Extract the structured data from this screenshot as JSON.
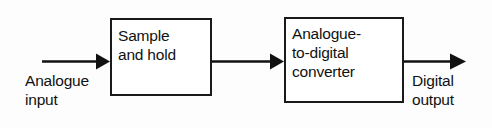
{
  "diagram": {
    "type": "block-diagram",
    "background_color": "#fdfdfd",
    "line_color": "#111111",
    "blocks": [
      {
        "id": "sample-and-hold",
        "label": "Sample\nand hold",
        "x": 110,
        "y": 18,
        "width": 102,
        "height": 78
      },
      {
        "id": "analogue-to-digital-converter",
        "label": "Analogue-\nto-digital\nconverter",
        "x": 284,
        "y": 17,
        "width": 120,
        "height": 86
      }
    ],
    "connections": [
      {
        "id": "analogue-input-wire",
        "from": "input-terminal",
        "to": "sample-and-hold",
        "arrowhead": "filled-triangle"
      },
      {
        "id": "sample-to-adc-wire",
        "from": "sample-and-hold",
        "to": "analogue-to-digital-converter",
        "arrowhead": "filled-triangle"
      },
      {
        "id": "digital-output-wire",
        "from": "analogue-to-digital-converter",
        "to": "output-terminal",
        "arrowhead": "filled-triangle"
      }
    ],
    "labels": [
      {
        "id": "analogue-input",
        "text": "Analogue\ninput",
        "x": 25,
        "y": 71
      },
      {
        "id": "digital-output",
        "text": "Digital\noutput",
        "x": 412,
        "y": 71
      }
    ]
  }
}
